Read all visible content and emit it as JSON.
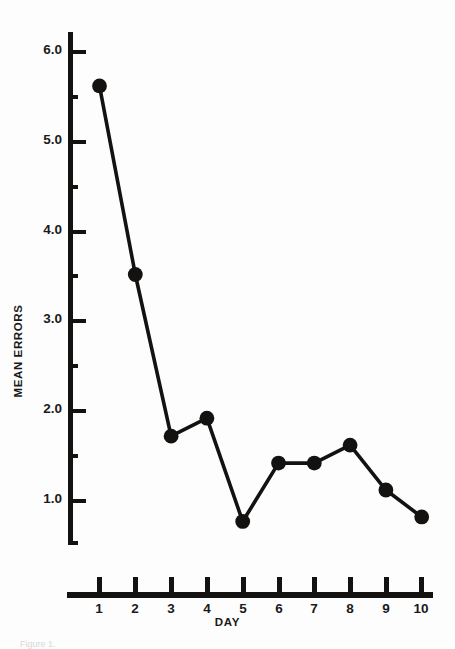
{
  "chart_data": {
    "type": "line",
    "title": "",
    "xlabel": "DAY",
    "ylabel": "MEAN ERRORS",
    "x": [
      1,
      2,
      3,
      4,
      5,
      6,
      7,
      8,
      9,
      10
    ],
    "categories": [
      "1",
      "2",
      "3",
      "4",
      "5",
      "6",
      "7",
      "8",
      "9",
      "10"
    ],
    "values": [
      5.6,
      3.5,
      1.7,
      1.9,
      0.75,
      1.4,
      1.4,
      1.6,
      1.1,
      0.8
    ],
    "series": [
      {
        "name": "Mean errors",
        "values": [
          5.6,
          3.5,
          1.7,
          1.9,
          0.75,
          1.4,
          1.4,
          1.6,
          1.1,
          0.8
        ]
      }
    ],
    "xlim": [
      0.5,
      10.5
    ],
    "ylim": [
      0.5,
      6.2
    ],
    "grid": false,
    "legend": "none",
    "marker": "filled-circle",
    "line_color": "#141210",
    "marker_color": "#141210",
    "y_major_ticks": [
      6.0,
      5.0,
      4.0,
      3.0,
      2.0,
      1.0
    ],
    "y_minor_ticks": [
      5.5,
      4.5,
      3.5,
      2.5,
      1.5,
      0.5
    ],
    "y_tick_labels": [
      "6.0",
      "5.0",
      "4.0",
      "3.0",
      "2.0",
      "1.0"
    ],
    "x_tick_labels": [
      "1",
      "2",
      "3",
      "4",
      "5",
      "6",
      "7",
      "8",
      "9",
      "10"
    ]
  },
  "axes": {
    "y_title": "MEAN ERRORS",
    "x_title": "DAY"
  },
  "caption": {
    "text": "Figure 1."
  }
}
